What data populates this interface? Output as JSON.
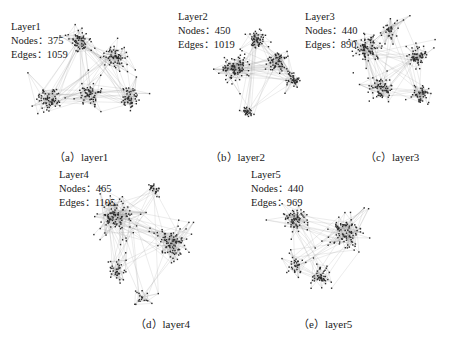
{
  "figure": {
    "panels": [
      {
        "id": "a",
        "layer_name": "Layer1",
        "nodes_label": "Nodes：",
        "nodes_value": "375",
        "edges_label": "Edges：",
        "edges_value": "1059",
        "caption": "（a）layer1",
        "clusters": 5
      },
      {
        "id": "b",
        "layer_name": "Layer2",
        "nodes_label": "Nodes：",
        "nodes_value": "450",
        "edges_label": "Edges：",
        "edges_value": "1019",
        "caption": "（b）layer2",
        "clusters": 5
      },
      {
        "id": "c",
        "layer_name": "Layer3",
        "nodes_label": "Nodes：",
        "nodes_value": "440",
        "edges_label": "Edges：",
        "edges_value": "890",
        "caption": "（c）layer3",
        "clusters": 5
      },
      {
        "id": "d",
        "layer_name": "Layer4",
        "nodes_label": "Nodes：",
        "nodes_value": "465",
        "edges_label": "Edges：",
        "edges_value": "1105",
        "caption": "（d）layer4",
        "clusters": 4
      },
      {
        "id": "e",
        "layer_name": "Layer5",
        "nodes_label": "Nodes：",
        "nodes_value": "440",
        "edges_label": "Edges：",
        "edges_value": "969",
        "caption": "（e）layer5",
        "clusters": 4
      }
    ],
    "colors": {
      "node": "#2b2b2b",
      "edge": "#9a9a9a",
      "text": "#1a1a1a",
      "background": "#ffffff"
    }
  }
}
